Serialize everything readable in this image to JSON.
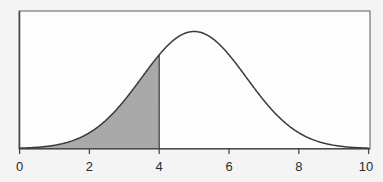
{
  "figure": {
    "background_color": "#f4f4f4",
    "plot_background_color": "#fdfdfd",
    "frame_color": "#6f6f6f",
    "curve_color": "#3a3a3a",
    "shade_color": "#a9a9a9",
    "axis_color": "#5a5a5a",
    "tick_label_color": "#2b2b2b"
  },
  "chart_data": {
    "type": "line",
    "title": "",
    "subtitle": "",
    "xlabel": "",
    "ylabel": "",
    "xlim": [
      0,
      10
    ],
    "ylim": [
      0,
      0.28
    ],
    "grid": false,
    "legend": null,
    "distribution": {
      "name": "normal",
      "mean": 5,
      "std_dev": 1.5,
      "peak_value": 0.266
    },
    "xticks": [
      0,
      2,
      4,
      6,
      8,
      10
    ],
    "xtick_labels": [
      "0",
      "2",
      "4",
      "6",
      "8",
      "10"
    ],
    "yticks": [],
    "ytick_labels": [],
    "shaded_region": {
      "label": "",
      "from": 0,
      "to": 4,
      "boundary_x": 4,
      "area": 0.2525,
      "fill_color": "#a9a9a9"
    },
    "series": [
      {
        "name": "normal-pdf",
        "x": [
          0,
          0.25,
          0.5,
          0.75,
          1,
          1.25,
          1.5,
          1.75,
          2,
          2.25,
          2.5,
          2.75,
          3,
          3.25,
          3.5,
          3.75,
          4,
          4.25,
          4.5,
          4.75,
          5,
          5.25,
          5.5,
          5.75,
          6,
          6.25,
          6.5,
          6.75,
          7,
          7.25,
          7.5,
          7.75,
          8,
          8.25,
          8.5,
          8.75,
          9,
          9.25,
          9.5,
          9.75,
          10
        ],
        "y": [
          0.00113,
          0.00199,
          0.00336,
          0.00547,
          0.00856,
          0.01291,
          0.01873,
          0.02616,
          0.03516,
          0.04547,
          0.05656,
          0.06769,
          0.07796,
          0.08648,
          0.09248,
          0.09545,
          0.09522,
          0.09194,
          0.08608,
          0.07834,
          0.06956,
          0.06057,
          0.05208,
          0.04462,
          0.03849,
          0.03383,
          0.03064,
          0.02884,
          0.02829,
          0.02884,
          0.03064,
          0.03383,
          0.03849,
          0.04462,
          0.05208,
          0.06057,
          0.06956,
          0.07834,
          0.08608,
          0.09194,
          0.09522
        ]
      }
    ]
  },
  "labels": {
    "tick_0": "0",
    "tick_2": "2",
    "tick_4": "4",
    "tick_6": "6",
    "tick_8": "8",
    "tick_10": "10"
  }
}
